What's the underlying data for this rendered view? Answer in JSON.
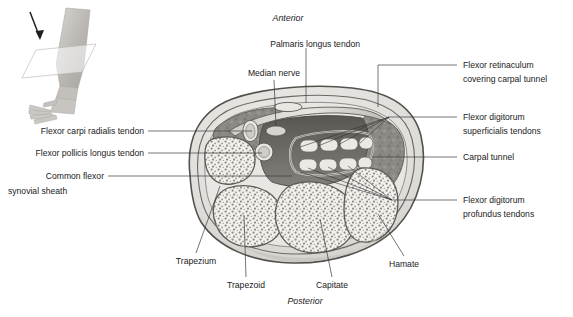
{
  "figure": {
    "orientation": {
      "anterior": "Anterior",
      "posterior": "Posterior"
    },
    "inset": {
      "name": "forearm-and-hand-orientation-inset",
      "description": "Forearm and hand with sectioning plane and direction-of-view arrow"
    },
    "labels": {
      "top": [
        {
          "id": "palmaris-longus-tendon",
          "text": "Palmaris longus tendon"
        },
        {
          "id": "median-nerve",
          "text": "Median nerve"
        }
      ],
      "left": [
        {
          "id": "flexor-carpi-radialis-tendon",
          "text": "Flexor carpi radialis tendon"
        },
        {
          "id": "flexor-pollicis-longus-tendon",
          "text": "Flexor pollicis longus tendon"
        },
        {
          "id": "common-flexor-synovial-sheath",
          "line1": "Common flexor",
          "line2": "synovial sheath"
        }
      ],
      "right": [
        {
          "id": "flexor-retinaculum",
          "line1": "Flexor retinaculum",
          "line2": "covering carpal tunnel"
        },
        {
          "id": "flexor-digitorum-superficialis-tendons",
          "line1": "Flexor digitorum",
          "line2": "superficialis tendons"
        },
        {
          "id": "carpal-tunnel",
          "line1": "Carpal tunnel",
          "line2": ""
        },
        {
          "id": "flexor-digitorum-profundus-tendons",
          "line1": "Flexor digitorum",
          "line2": "profundus tendons"
        }
      ],
      "bottom": [
        {
          "id": "trapezium",
          "text": "Trapezium"
        },
        {
          "id": "trapezoid",
          "text": "Trapezoid"
        },
        {
          "id": "capitate",
          "text": "Capitate"
        },
        {
          "id": "hamate",
          "text": "Hamate"
        }
      ]
    },
    "structures": {
      "carpal_bones": [
        "Trapezium",
        "Trapezoid",
        "Capitate",
        "Hamate"
      ],
      "superficialis_tendon_count": 4,
      "profundus_tendon_count": 4,
      "other": [
        "Palmaris longus tendon",
        "Median nerve",
        "Flexor carpi radialis tendon",
        "Flexor pollicis longus tendon",
        "Flexor retinaculum",
        "Common flexor synovial sheath"
      ]
    },
    "colors": {
      "outline": "#4a4a4a",
      "skin_fill": "#e4e2de",
      "muscle_fill": "#8f8c88",
      "bone_fill": "#f0eeea",
      "bone_speckle": "#8d8a86",
      "tendon_fill": "#e8e6e2",
      "tunnel_dark": "#5e5b57",
      "leader_line": "#3b3b3b",
      "text": "#1a1a1a",
      "background": "#ffffff"
    }
  }
}
